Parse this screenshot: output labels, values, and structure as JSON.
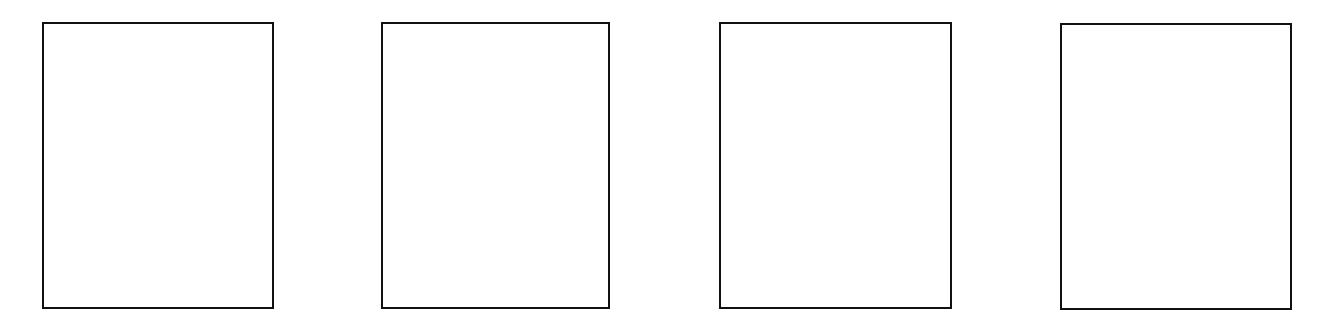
{
  "panels": [
    {
      "label": "",
      "border_color": "#111111",
      "fill_color": "#ffffff"
    },
    {
      "label": "",
      "border_color": "#111111",
      "fill_color": "#ffffff"
    },
    {
      "label": "",
      "border_color": "#111111",
      "fill_color": "#ffffff"
    },
    {
      "label": "",
      "border_color": "#111111",
      "fill_color": "#ffffff"
    }
  ],
  "background_color": "#ffffff"
}
